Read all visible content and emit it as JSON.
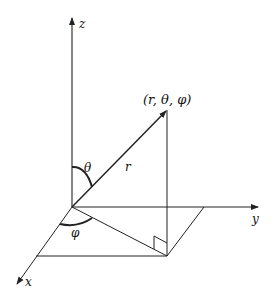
{
  "diagram": {
    "type": "spherical-coordinates",
    "labels": {
      "z_axis": "z",
      "y_axis": "y",
      "x_axis": "x",
      "point": "(r, θ, φ)",
      "radius": "r",
      "polar_angle": "θ",
      "azimuth_angle": "φ"
    },
    "colors": {
      "line": "#222222",
      "background": "#ffffff"
    }
  }
}
